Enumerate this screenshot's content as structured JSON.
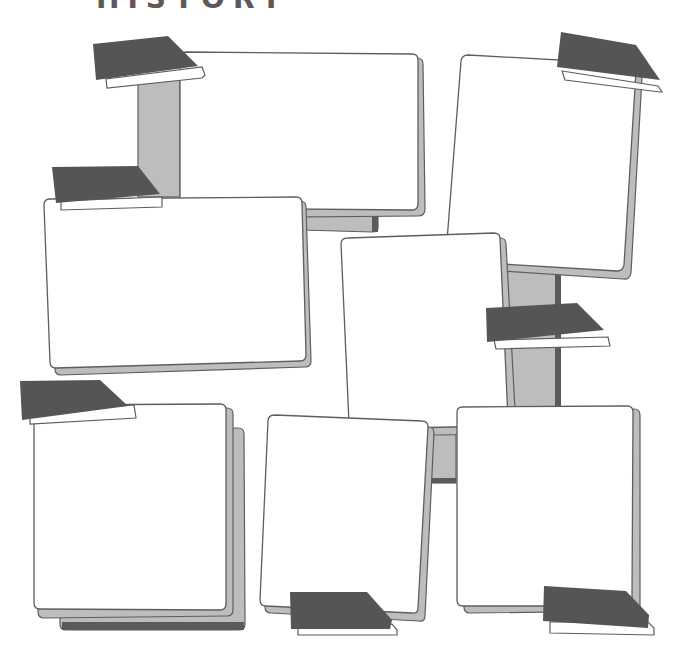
{
  "page": {
    "title_partial": "HISTORY",
    "colors": {
      "background": "#ffffff",
      "frame_fill": "#ffffff",
      "frame_stroke": "#5e5e5e",
      "shadow_light": "#bdbdbd",
      "shadow_dark": "#5a5a5a",
      "tab_fill": "#555555"
    }
  },
  "frames": [
    {
      "id": "frame-top-center",
      "label": ""
    },
    {
      "id": "frame-top-right",
      "label": ""
    },
    {
      "id": "frame-mid-left",
      "label": ""
    },
    {
      "id": "frame-center",
      "label": ""
    },
    {
      "id": "frame-bottom-left",
      "label": ""
    },
    {
      "id": "frame-bottom-center",
      "label": ""
    },
    {
      "id": "frame-bottom-right",
      "label": ""
    }
  ]
}
